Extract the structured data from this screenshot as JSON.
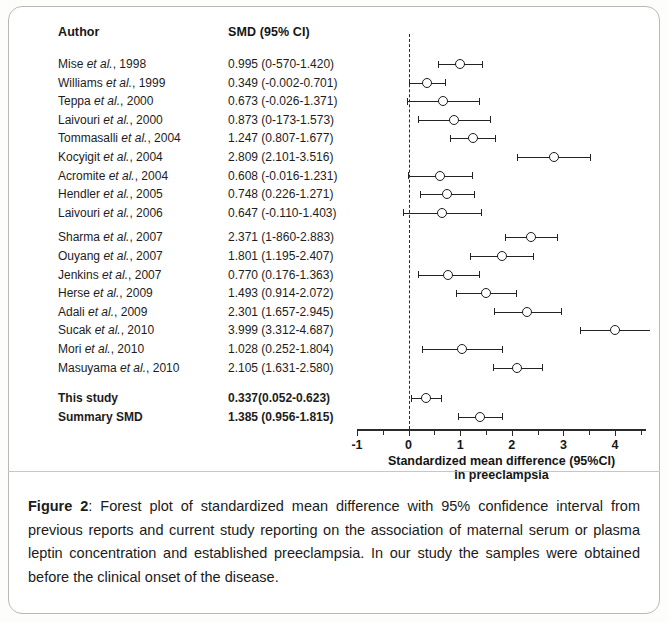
{
  "figure": {
    "columns": {
      "author_header": "Author",
      "smd_header": "SMD (95% CI)"
    },
    "axis": {
      "title_line1": "Standardized mean difference (95%CI)",
      "title_line2": "in preeclampsia",
      "tick_labels": [
        "-1",
        "0",
        "1",
        "2",
        "3",
        "4"
      ],
      "tick_values": [
        -1,
        0,
        1,
        2,
        3,
        4
      ],
      "xmin": -1,
      "xmax": 4.6,
      "reference_line": 0
    },
    "rows": [
      {
        "author": "Mise et al., 1998",
        "value_text": "0.995 (0-570-1.420)",
        "smd": 0.995,
        "low": 0.57,
        "high": 1.42,
        "bold": false
      },
      {
        "author": "Williams et al., 1999",
        "value_text": "0.349 (-0.002-0.701)",
        "smd": 0.349,
        "low": -0.002,
        "high": 0.701,
        "bold": false
      },
      {
        "author": "Teppa et al., 2000",
        "value_text": "0.673 (-0.026-1.371)",
        "smd": 0.673,
        "low": -0.026,
        "high": 1.371,
        "bold": false
      },
      {
        "author": "Laivouri et al., 2000",
        "value_text": "0.873 (0-173-1.573)",
        "smd": 0.873,
        "low": 0.173,
        "high": 1.573,
        "bold": false
      },
      {
        "author": "Tommasalli et al., 2004",
        "value_text": "1.247 (0.807-1.677)",
        "smd": 1.247,
        "low": 0.807,
        "high": 1.677,
        "bold": false
      },
      {
        "author": "Kocyigit et al., 2004",
        "value_text": "2.809 (2.101-3.516)",
        "smd": 2.809,
        "low": 2.101,
        "high": 3.516,
        "bold": false
      },
      {
        "author": "Acromite et al., 2004",
        "value_text": "0.608 (-0.016-1.231)",
        "smd": 0.608,
        "low": -0.016,
        "high": 1.231,
        "bold": false
      },
      {
        "author": "Hendler et al., 2005",
        "value_text": "0.748 (0.226-1.271)",
        "smd": 0.748,
        "low": 0.226,
        "high": 1.271,
        "bold": false
      },
      {
        "author": "Laivouri et al., 2006",
        "value_text": "0.647 (-0.110-1.403)",
        "smd": 0.647,
        "low": -0.11,
        "high": 1.403,
        "bold": false
      },
      {
        "author": "Sharma et al., 2007",
        "value_text": "2.371 (1-860-2.883)",
        "smd": 2.371,
        "low": 1.86,
        "high": 2.883,
        "bold": false
      },
      {
        "author": "Ouyang et al., 2007",
        "value_text": "1.801 (1.195-2.407)",
        "smd": 1.801,
        "low": 1.195,
        "high": 2.407,
        "bold": false
      },
      {
        "author": "Jenkins et al., 2007",
        "value_text": "0.770 (0.176-1.363)",
        "smd": 0.77,
        "low": 0.176,
        "high": 1.363,
        "bold": false
      },
      {
        "author": "Herse et al., 2009",
        "value_text": "1.493 (0.914-2.072)",
        "smd": 1.493,
        "low": 0.914,
        "high": 2.072,
        "bold": false
      },
      {
        "author": "Adali et al., 2009",
        "value_text": "2.301 (1.657-2.945)",
        "smd": 2.301,
        "low": 1.657,
        "high": 2.945,
        "bold": false
      },
      {
        "author": "Sucak et al., 2010",
        "value_text": "3.999 (3.312-4.687)",
        "smd": 3.999,
        "low": 3.312,
        "high": 4.687,
        "bold": false
      },
      {
        "author": "Mori et al., 2010",
        "value_text": "1.028 (0.252-1.804)",
        "smd": 1.028,
        "low": 0.252,
        "high": 1.804,
        "bold": false
      },
      {
        "author": "Masuyama et al., 2010",
        "value_text": "2.105 (1.631-2.580)",
        "smd": 2.105,
        "low": 1.631,
        "high": 2.58,
        "bold": false
      },
      {
        "author": "This study",
        "value_text": "0.337(0.052-0.623)",
        "smd": 0.337,
        "low": 0.052,
        "high": 0.623,
        "bold": true
      },
      {
        "author": "Summary SMD",
        "value_text": "1.385 (0.956-1.815)",
        "smd": 1.385,
        "low": 0.956,
        "high": 1.815,
        "bold": true
      }
    ]
  },
  "caption": {
    "label": "Figure 2",
    "text": ": Forest plot of standardized mean difference with 95% confidence interval from previous reports and current study reporting on the association of maternal serum or plasma leptin concentration and established preeclampsia. In our study the samples were obtained before the clinical onset of the disease."
  },
  "chart_data": {
    "type": "forest",
    "title": "",
    "xlabel": "Standardized mean difference (95%CI) in preeclampsia",
    "ylabel": "",
    "xlim": [
      -1,
      4.6
    ],
    "xticks": [
      -1,
      0,
      1,
      2,
      3,
      4
    ],
    "grid": false,
    "legend": "none",
    "reference_line": 0,
    "categories": [
      "Mise et al., 1998",
      "Williams et al., 1999",
      "Teppa et al., 2000",
      "Laivouri et al., 2000",
      "Tommasalli et al., 2004",
      "Kocyigit et al., 2004",
      "Acromite et al., 2004",
      "Hendler et al., 2005",
      "Laivouri et al., 2006",
      "Sharma et al., 2007",
      "Ouyang et al., 2007",
      "Jenkins et al., 2007",
      "Herse et al., 2009",
      "Adali et al., 2009",
      "Sucak et al., 2010",
      "Mori et al., 2010",
      "Masuyama et al., 2010",
      "This study",
      "Summary SMD"
    ],
    "values": [
      0.995,
      0.349,
      0.673,
      0.873,
      1.247,
      2.809,
      0.608,
      0.748,
      0.647,
      2.371,
      1.801,
      0.77,
      1.493,
      2.301,
      3.999,
      1.028,
      2.105,
      0.337,
      1.385
    ],
    "ci_low": [
      0.57,
      -0.002,
      -0.026,
      0.173,
      0.807,
      2.101,
      -0.016,
      0.226,
      -0.11,
      1.86,
      1.195,
      0.176,
      0.914,
      1.657,
      3.312,
      0.252,
      1.631,
      0.052,
      0.956
    ],
    "ci_high": [
      1.42,
      0.701,
      1.371,
      1.573,
      1.677,
      3.516,
      1.231,
      1.271,
      1.403,
      2.883,
      2.407,
      1.363,
      2.072,
      2.945,
      4.687,
      1.804,
      2.58,
      0.623,
      1.815
    ]
  }
}
